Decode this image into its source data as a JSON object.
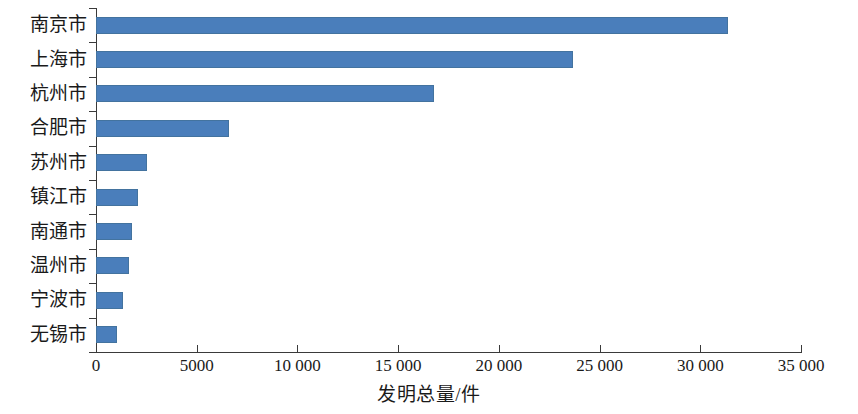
{
  "chart_data": {
    "type": "bar",
    "orientation": "horizontal",
    "title": "",
    "xlabel": "发明总量/件",
    "ylabel": "",
    "categories": [
      "南京市",
      "上海市",
      "杭州市",
      "合肥市",
      "苏州市",
      "镇江市",
      "南通市",
      "温州市",
      "宁波市",
      "无锡市"
    ],
    "values": [
      31400,
      23700,
      16800,
      6600,
      2550,
      2100,
      1800,
      1650,
      1350,
      1050
    ],
    "series": [
      {
        "name": "发明总量",
        "values": [
          31400,
          23700,
          16800,
          6600,
          2550,
          2100,
          1800,
          1650,
          1350,
          1050
        ]
      }
    ],
    "xlim": [
      0,
      35000
    ],
    "xticks": [
      0,
      5000,
      10000,
      15000,
      20000,
      25000,
      30000,
      35000
    ],
    "xtick_labels": [
      "0",
      "5000",
      "10 000",
      "15 000",
      "20 000",
      "25 000",
      "30 000",
      "35 000"
    ],
    "grid": false,
    "legend": false,
    "bar_color": "#4a7ebb",
    "axis_color": "#3a3a3a"
  }
}
